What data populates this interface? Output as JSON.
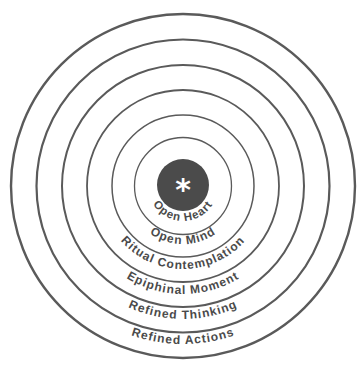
{
  "diagram": {
    "type": "concentric-circles",
    "center_symbol": "*",
    "colors": {
      "background": "#ffffff",
      "ring_stroke": "#5a5a5a",
      "core_fill": "#4b4b4b",
      "label_text": "#4a4a4a",
      "symbol": "#ffffff"
    },
    "layers": [
      {
        "label": "Open Heart"
      },
      {
        "label": "Open Mind"
      },
      {
        "label": "Ritual Contemplation"
      },
      {
        "label": "Epiphinal Moment"
      },
      {
        "label": "Refined Thinking"
      },
      {
        "label": "Refined Actions"
      }
    ]
  }
}
